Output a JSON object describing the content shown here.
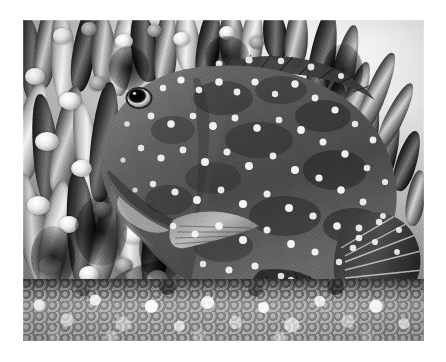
{
  "page": {
    "background_color": "#ffffff",
    "width": 446,
    "height": 362
  },
  "photograph": {
    "caption": "Black-and-white photograph of a spotted grouper resting beside branching coral above a gravel bed",
    "medium": "monochrome halftone photograph",
    "frame": {
      "left": 23,
      "top": 20,
      "width": 401,
      "height": 321
    },
    "tonal_range": {
      "highlight": "#fbfbfb",
      "light_mid": "#c9c9c9",
      "mid": "#8d8d8d",
      "dark_mid": "#555555",
      "shadow": "#101010"
    }
  },
  "subject": {
    "name": "spotted grouper",
    "orientation": "facing left, body filling the centre and right of the frame",
    "body_tone": "#5a5a5a",
    "spot_color": "#f4f4f4",
    "parts": [
      {
        "name": "head",
        "note": "large jaw and lips at left, tapering snout"
      },
      {
        "name": "eye",
        "note": "dark round pupil with pale iris ring"
      },
      {
        "name": "dorsal-fin",
        "note": "spiny rays running along the upper back"
      },
      {
        "name": "pectoral-fin",
        "note": "pale translucent fin low on the flank"
      },
      {
        "name": "anal-fin",
        "note": "dark spotted fin beneath the rear body"
      },
      {
        "name": "caudal-fin",
        "note": "rounded tail with radiating rays and pale spots"
      }
    ],
    "markings": "dense pale round spots covering head, flanks and fins"
  },
  "background": {
    "elements": [
      {
        "name": "branching-coral",
        "note": "thicket of pale-tipped coral branches filling the left and upper frame"
      },
      {
        "name": "open-water",
        "note": "bright washed-out area at the upper right"
      },
      {
        "name": "gravel-bed",
        "note": "band of coarse pebbles across the bottom of the frame"
      }
    ]
  }
}
